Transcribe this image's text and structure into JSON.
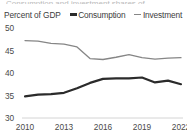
{
  "title_sliver": "Consumption and investment shares of GDP",
  "axis_title": "Percent of GDP",
  "legend": [
    {
      "label": "Consumption",
      "color": "#2b2b2b",
      "key": "consumption"
    },
    {
      "label": "Investment",
      "color": "#868686",
      "key": "investment"
    }
  ],
  "chart_data": {
    "type": "line",
    "title": "",
    "xlabel": "",
    "ylabel": "Percent of GDP",
    "ylim": [
      30,
      50
    ],
    "xlim": [
      2010,
      2022
    ],
    "ytick_labels": [
      "50",
      "45",
      "40",
      "35",
      "30"
    ],
    "yticks": [
      50,
      45,
      40,
      35,
      30
    ],
    "xtick_labels": [
      "2010",
      "2013",
      "2016",
      "2019",
      "2022"
    ],
    "xticks": [
      2010,
      2013,
      2016,
      2019,
      2022
    ],
    "x": [
      2010,
      2011,
      2012,
      2013,
      2014,
      2015,
      2016,
      2017,
      2018,
      2019,
      2020,
      2021,
      2022
    ],
    "grid": false,
    "legend_position": "top",
    "series": [
      {
        "name": "Consumption",
        "color": "#2b2b2b",
        "width": 2.2,
        "values": [
          34.8,
          35.2,
          35.3,
          35.6,
          36.6,
          37.8,
          38.7,
          38.8,
          38.8,
          39.0,
          37.9,
          38.3,
          37.5
        ]
      },
      {
        "name": "Investment",
        "color": "#868686",
        "width": 1.3,
        "values": [
          47.2,
          47.1,
          46.6,
          46.4,
          45.8,
          43.2,
          43.0,
          43.5,
          44.1,
          43.4,
          43.1,
          43.3,
          43.4
        ]
      }
    ]
  }
}
